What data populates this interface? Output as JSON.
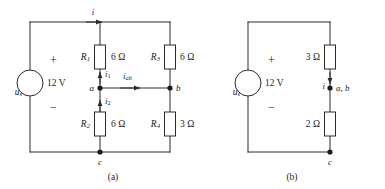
{
  "figure": {
    "background_color": "#ffffff",
    "line_color": "#2b2b2b",
    "text_color": "#1c1c1c"
  },
  "panels": [
    {
      "id": "panel-a",
      "caption": "(a)",
      "source": {
        "name": "u",
        "subscript": "s",
        "value": "12 V",
        "plus_sign": "+",
        "minus_sign": "−"
      },
      "currents": [
        {
          "name": "i",
          "subscript": "",
          "direction": "right",
          "location": "top-wire"
        },
        {
          "name": "i",
          "subscript": "1",
          "direction": "up",
          "location": "above-node-a"
        },
        {
          "name": "i",
          "subscript": "2",
          "direction": "up",
          "location": "below-node-a"
        },
        {
          "name": "i",
          "subscript": "ab",
          "direction": "right",
          "location": "bridge-a-to-b"
        }
      ],
      "resistors": [
        {
          "name": "R",
          "subscript": "1",
          "value": "6 Ω",
          "position": "upper-middle"
        },
        {
          "name": "R",
          "subscript": "2",
          "value": "6 Ω",
          "position": "lower-middle"
        },
        {
          "name": "R",
          "subscript": "3",
          "value": "6 Ω",
          "position": "upper-right"
        },
        {
          "name": "R",
          "subscript": "4",
          "value": "3 Ω",
          "position": "lower-right"
        }
      ],
      "nodes": [
        {
          "label": "a",
          "position": "middle-branch-mid"
        },
        {
          "label": "b",
          "position": "right-branch-mid"
        },
        {
          "label": "c",
          "position": "bottom-wire-middle"
        }
      ]
    },
    {
      "id": "panel-b",
      "caption": "(b)",
      "source": {
        "name": "u",
        "subscript": "s",
        "value": "12 V",
        "plus_sign": "+",
        "minus_sign": "−"
      },
      "currents": [
        {
          "name": "i",
          "subscript": "",
          "direction": "down",
          "location": "right-branch"
        }
      ],
      "resistors": [
        {
          "name": "",
          "subscript": "",
          "value": "3 Ω",
          "position": "upper-right"
        },
        {
          "name": "",
          "subscript": "",
          "value": "2 Ω",
          "position": "lower-right"
        }
      ],
      "nodes": [
        {
          "label": "a, b",
          "position": "right-branch-mid"
        },
        {
          "label": "c",
          "position": "bottom-right"
        }
      ]
    }
  ]
}
